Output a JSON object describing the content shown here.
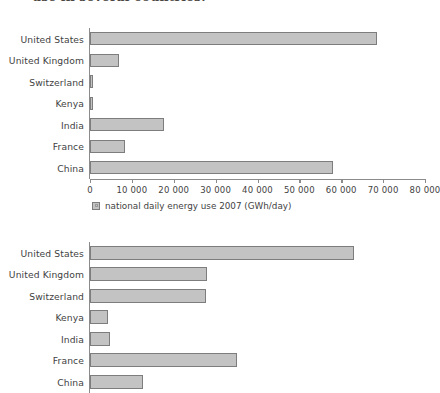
{
  "caption": {
    "text": "use in several countries."
  },
  "chart_data": [
    {
      "id": "chart-top",
      "type": "bar",
      "orientation": "horizontal",
      "title": "",
      "xlabel": "",
      "ylabel": "",
      "xlim": [
        0,
        80000
      ],
      "grid": false,
      "legend": {
        "position": "bottom",
        "entries": [
          "national daily energy use 2007 (GWh/day)"
        ]
      },
      "tick_labels": [
        "0",
        "10 000",
        "20 000",
        "30 000",
        "40 000",
        "50 000",
        "60 000",
        "70 000",
        "80 000"
      ],
      "ticks": [
        0,
        10000,
        20000,
        30000,
        40000,
        50000,
        60000,
        70000,
        80000
      ],
      "categories": [
        "United States",
        "United Kingdom",
        "Switzerland",
        "Kenya",
        "India",
        "France",
        "China"
      ],
      "values": [
        68500,
        7000,
        700,
        700,
        17600,
        8400,
        58000
      ],
      "series": [
        {
          "name": "national daily energy use 2007 (GWh/day)",
          "values": [
            68500,
            7000,
            700,
            700,
            17600,
            8400,
            58000
          ]
        }
      ]
    },
    {
      "id": "chart-bottom",
      "type": "bar",
      "orientation": "horizontal",
      "title": "",
      "xlabel": "",
      "ylabel": "",
      "xlim": [
        0,
        80000
      ],
      "grid": false,
      "legend": {
        "position": "none",
        "entries": []
      },
      "tick_labels": [],
      "ticks": [],
      "categories": [
        "United States",
        "United Kingdom",
        "Switzerland",
        "Kenya",
        "India",
        "France",
        "China"
      ],
      "values": [
        63000,
        28000,
        27800,
        4300,
        4800,
        35000,
        12600
      ],
      "series": [
        {
          "name": "per-capita daily energy use",
          "values": [
            63000,
            28000,
            27800,
            4300,
            4800,
            35000,
            12600
          ]
        }
      ]
    }
  ]
}
